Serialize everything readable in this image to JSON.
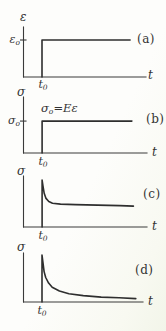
{
  "figure": {
    "description_labels": {
      "panel_a_tag": "(a)",
      "panel_b_tag": "(b)",
      "panel_c_tag": "(c)",
      "panel_d_tag": "(d)"
    }
  },
  "colors": {
    "ink": "#3a3a3a",
    "curve": "#2e2e2e",
    "paper": "#fcfcf9"
  },
  "chart_data": [
    {
      "id": "a",
      "type": "line",
      "title": "step strain input held constant",
      "panel_tag": "(a)",
      "xlabel": "t",
      "ylabel": "ε",
      "x_tick": {
        "base": "t",
        "sub": "0"
      },
      "y_tick": {
        "base": "ε",
        "sub": "o"
      },
      "y_tick_frac": 0.74,
      "xlim": [
        0,
        1
      ],
      "ylim": [
        0,
        1
      ],
      "box": {
        "left": 23.5,
        "right": 146,
        "top": 27,
        "bottom": 77
      },
      "series": [
        {
          "name": "ε(t) step at t0",
          "points": [
            [
              0.151,
              0
            ],
            [
              0.151,
              0.74
            ],
            [
              0.87,
              0.74
            ]
          ]
        }
      ]
    },
    {
      "id": "b",
      "type": "line",
      "title": "elastic stress response, constant",
      "panel_tag": "(b)",
      "xlabel": "t",
      "ylabel": "σ",
      "x_tick": {
        "base": "t",
        "sub": "0"
      },
      "y_tick": {
        "base": "σ",
        "sub": "o"
      },
      "y_tick_frac": 0.57,
      "annotation": {
        "base": "σ",
        "sub": "o",
        "rest": "=Eε"
      },
      "xlim": [
        0,
        1
      ],
      "ylim": [
        0,
        1
      ],
      "box": {
        "left": 23.5,
        "right": 147,
        "top": 97,
        "bottom": 153
      },
      "series": [
        {
          "name": "σ(t) step at t0",
          "points": [
            [
              0.151,
              0
            ],
            [
              0.151,
              0.57
            ],
            [
              0.878,
              0.57
            ]
          ]
        }
      ]
    },
    {
      "id": "c",
      "type": "line",
      "title": "stress relaxation to a plateau",
      "panel_tag": "(c)",
      "xlabel": "t",
      "ylabel": "σ",
      "x_tick": {
        "base": "t",
        "sub": "0"
      },
      "xlim": [
        0,
        1
      ],
      "ylim": [
        0,
        1
      ],
      "box": {
        "left": 23.5,
        "right": 147,
        "top": 176,
        "bottom": 227
      },
      "series": [
        {
          "name": "σ(t) decays to equilibrium plateau",
          "points": [
            [
              0.151,
              0
            ],
            [
              0.151,
              0.92
            ],
            [
              0.158,
              0.8
            ],
            [
              0.168,
              0.66
            ],
            [
              0.182,
              0.56
            ],
            [
              0.205,
              0.5
            ],
            [
              0.235,
              0.465
            ],
            [
              0.3,
              0.45
            ],
            [
              0.42,
              0.44
            ],
            [
              0.6,
              0.43
            ],
            [
              0.78,
              0.42
            ],
            [
              0.89,
              0.41
            ]
          ]
        }
      ]
    },
    {
      "id": "d",
      "type": "line",
      "title": "stress relaxation toward zero",
      "panel_tag": "(d)",
      "xlabel": "t",
      "ylabel": "σ",
      "x_tick": {
        "base": "t",
        "sub": "0"
      },
      "xlim": [
        0,
        1
      ],
      "ylim": [
        0,
        1
      ],
      "box": {
        "left": 23.5,
        "right": 143,
        "top": 253,
        "bottom": 302
      },
      "series": [
        {
          "name": "σ(t) decays toward zero",
          "points": [
            [
              0.155,
              0
            ],
            [
              0.155,
              0.96
            ],
            [
              0.163,
              0.8
            ],
            [
              0.172,
              0.62
            ],
            [
              0.186,
              0.5
            ],
            [
              0.21,
              0.385
            ],
            [
              0.24,
              0.3
            ],
            [
              0.3,
              0.225
            ],
            [
              0.38,
              0.17
            ],
            [
              0.5,
              0.13
            ],
            [
              0.65,
              0.1
            ],
            [
              0.8,
              0.085
            ],
            [
              0.94,
              0.07
            ]
          ]
        }
      ]
    }
  ]
}
